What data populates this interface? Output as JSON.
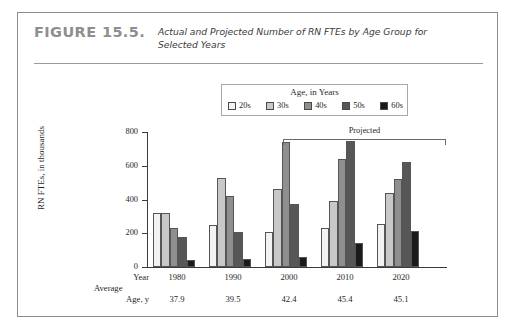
{
  "figure": {
    "number": "FIGURE 15.5.",
    "caption": "Actual and Projected Number of RN FTEs by Age Group for Selected Years"
  },
  "legend": {
    "title": "Age, in Years",
    "items": [
      {
        "label": "20s",
        "color": "#f2f2f2"
      },
      {
        "label": "30s",
        "color": "#c8c8c8"
      },
      {
        "label": "40s",
        "color": "#8f8f8f"
      },
      {
        "label": "50s",
        "color": "#575757"
      },
      {
        "label": "60s",
        "color": "#1a1a1a"
      }
    ]
  },
  "annotation": {
    "projected_label": "Projected"
  },
  "axis_rows": {
    "year_label": "Year",
    "average_label": "Average",
    "age_label": "Age, y"
  },
  "chart_data": {
    "type": "bar",
    "title": "Actual and Projected Number of RN FTEs by Age Group for Selected Years",
    "xlabel": "Year",
    "ylabel": "RN FTEs, in thousands",
    "ylim": [
      0,
      800
    ],
    "yticks": [
      0,
      200,
      400,
      600,
      800
    ],
    "ytick_labels": [
      "0",
      "200",
      "400",
      "600",
      "800"
    ],
    "grid": false,
    "legend_position": "top-center",
    "categories": [
      "1980",
      "1990",
      "2000",
      "2010",
      "2020"
    ],
    "average_age": [
      "37.9",
      "39.5",
      "42.4",
      "45.4",
      "45.1"
    ],
    "projected_categories": [
      "2000",
      "2010",
      "2020"
    ],
    "series": [
      {
        "name": "20s",
        "color": "#f2f2f2",
        "values": [
          320,
          250,
          210,
          230,
          255
        ]
      },
      {
        "name": "30s",
        "color": "#c8c8c8",
        "values": [
          320,
          530,
          465,
          390,
          440
        ]
      },
      {
        "name": "40s",
        "color": "#8f8f8f",
        "values": [
          230,
          420,
          740,
          640,
          520
        ]
      },
      {
        "name": "50s",
        "color": "#575757",
        "values": [
          175,
          205,
          375,
          745,
          625
        ]
      },
      {
        "name": "60s",
        "color": "#1a1a1a",
        "values": [
          40,
          45,
          60,
          140,
          215
        ]
      }
    ]
  }
}
